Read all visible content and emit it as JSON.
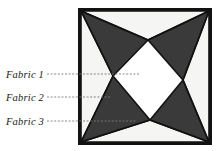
{
  "figure": {
    "colors": {
      "fabric_dark": "#3a3a3a",
      "fabric_light": "#f5f5f3",
      "outline": "#121212",
      "leader_line": "#7a7a7a",
      "label_text": "#1a1a1a",
      "background": "#ffffff"
    },
    "block": {
      "x": 78,
      "y": 8,
      "width": 134,
      "height": 137,
      "border_width": 3
    },
    "labels": [
      {
        "id": "fabric-1",
        "text": "Fabric 1",
        "text_x": 6,
        "text_y": 78,
        "leader_from_x": 47,
        "leader_to_x": 140,
        "leader_y": 74,
        "target": "center-left-vertex"
      },
      {
        "id": "fabric-2",
        "text": "Fabric 2",
        "text_x": 6,
        "text_y": 101,
        "leader_from_x": 47,
        "leader_to_x": 110,
        "leader_y": 97,
        "target": "left-dark-wedge"
      },
      {
        "id": "fabric-3",
        "text": "Fabric 3",
        "text_x": 6,
        "text_y": 125,
        "leader_from_x": 47,
        "leader_to_x": 137,
        "leader_y": 121,
        "target": "bottom-light-triangle"
      }
    ],
    "geometry": {
      "corners": {
        "top_left": [
          81,
          11
        ],
        "top_right": [
          209,
          11
        ],
        "bottom_right": [
          209,
          142
        ],
        "bottom_left": [
          81,
          142
        ]
      },
      "diamond_vertices": {
        "top": [
          148,
          40
        ],
        "right": [
          183,
          80
        ],
        "bottom": [
          150,
          120
        ],
        "left": [
          113,
          76
        ]
      },
      "description": "Square block with four light triangles radiating from edge midpoints toward a central light diamond, over a dark background field."
    }
  }
}
